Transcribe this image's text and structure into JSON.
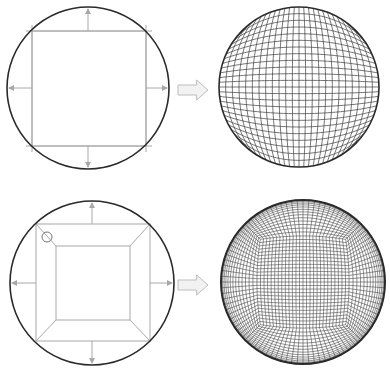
{
  "figure": {
    "width": 390,
    "height": 378,
    "background": "#ffffff",
    "colors": {
      "circle_outline": "#2a2a2a",
      "construction_line": "#a8a8a8",
      "mesh_line": "#3a3a3a",
      "arrow_fill": "#f2f2f2",
      "arrow_stroke": "#bdbdbd"
    },
    "rows": [
      {
        "name": "single-block-mapping",
        "input": {
          "circle": {
            "cx": 88,
            "cy": 88,
            "r": 81
          },
          "square": {
            "x0": 32,
            "y0": 31,
            "x1": 146,
            "y1": 146
          },
          "projection_arrows": [
            "up",
            "down",
            "left",
            "right"
          ]
        },
        "transition_arrow": {
          "x": 178,
          "y": 80,
          "w": 30,
          "h": 20,
          "direction": "right-arrow-icon"
        },
        "output": {
          "type": "structured-grid-on-disc",
          "circle": {
            "cx": 299,
            "cy": 87,
            "r": 80
          },
          "grid_divisions": 24
        }
      },
      {
        "name": "o-grid-mapping",
        "input": {
          "circle": {
            "cx": 92,
            "cy": 283,
            "r": 82
          },
          "outer_square": {
            "x0": 36,
            "y0": 224,
            "x1": 150,
            "y1": 341
          },
          "inner_square": {
            "x0": 56,
            "y0": 246,
            "x1": 130,
            "y1": 320
          },
          "marker_circle": {
            "cx": 47,
            "cy": 237,
            "r": 5
          },
          "projection_arrows": [
            "up",
            "down",
            "left",
            "right"
          ]
        },
        "transition_arrow": {
          "x": 178,
          "y": 275,
          "w": 30,
          "h": 20,
          "direction": "right-arrow-icon"
        },
        "output": {
          "type": "o-grid-mesh-on-disc",
          "circle": {
            "cx": 303,
            "cy": 282,
            "r": 82
          },
          "inner_divisions": 26,
          "radial_divisions": 14,
          "inner_half_fraction": 0.52
        }
      }
    ]
  }
}
